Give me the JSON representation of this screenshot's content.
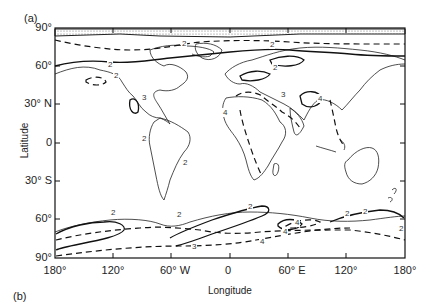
{
  "figure": {
    "panel_a_label": "(a)",
    "panel_b_label": "(b)",
    "xlabel": "Longitude",
    "ylabel": "Latitude",
    "yticks": [
      {
        "label": "90°",
        "y": 28
      },
      {
        "label": "60°",
        "y": 66
      },
      {
        "label": "30° N",
        "y": 104
      },
      {
        "label": "0",
        "y": 143
      },
      {
        "label": "30° S",
        "y": 181
      },
      {
        "label": "60°",
        "y": 219
      },
      {
        "label": "90°",
        "y": 258
      }
    ],
    "xticks": [
      {
        "label": "180°",
        "x": 55
      },
      {
        "label": "120°",
        "x": 113
      },
      {
        "label": "60° W",
        "x": 171
      },
      {
        "label": "0",
        "x": 230
      },
      {
        "label": "60° E",
        "x": 288
      },
      {
        "label": "120°",
        "x": 346
      },
      {
        "label": "180°",
        "x": 405
      }
    ],
    "contour_labels": [
      {
        "text": "2",
        "x": 110,
        "y": 66
      },
      {
        "text": "2",
        "x": 116,
        "y": 77
      },
      {
        "text": "2",
        "x": 184,
        "y": 45
      },
      {
        "text": "3",
        "x": 144,
        "y": 99
      },
      {
        "text": "2",
        "x": 272,
        "y": 46
      },
      {
        "text": "2",
        "x": 275,
        "y": 69
      },
      {
        "text": "3",
        "x": 283,
        "y": 96
      },
      {
        "text": "4",
        "x": 320,
        "y": 100
      },
      {
        "text": "4",
        "x": 225,
        "y": 114
      },
      {
        "text": "2",
        "x": 144,
        "y": 140
      },
      {
        "text": "2",
        "x": 185,
        "y": 164
      },
      {
        "text": "2",
        "x": 347,
        "y": 215
      },
      {
        "text": "2",
        "x": 250,
        "y": 208
      },
      {
        "text": "2",
        "x": 113,
        "y": 214
      },
      {
        "text": "2",
        "x": 179,
        "y": 216
      },
      {
        "text": "4",
        "x": 297,
        "y": 224
      },
      {
        "text": "4",
        "x": 262,
        "y": 243
      },
      {
        "text": "4",
        "x": 285,
        "y": 233
      },
      {
        "text": "3",
        "x": 194,
        "y": 248
      },
      {
        "text": "2",
        "x": 365,
        "y": 213
      },
      {
        "text": "2",
        "x": 401,
        "y": 230
      }
    ],
    "colors": {
      "line": "#1a1a1a",
      "land": "#333333",
      "hatch": "#888888"
    }
  }
}
